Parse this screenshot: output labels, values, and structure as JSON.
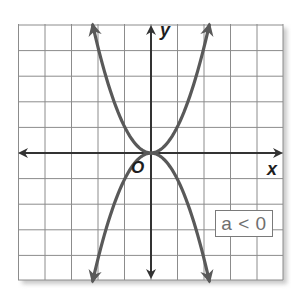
{
  "figure": {
    "x_axis_label": "x",
    "y_axis_label": "y",
    "origin_label": "O",
    "legend_text": "a < 0"
  },
  "colors": {
    "grid": "#8c8c8c",
    "axes": "#333333",
    "curves": "#595959",
    "legend_text": "#6f6f6f",
    "legend_border": "#7a7a7a",
    "shadow": "#c9c9c9"
  },
  "chart_data": {
    "type": "line",
    "title": "",
    "xlabel": "x",
    "ylabel": "y",
    "xlim": [
      -5,
      5
    ],
    "ylim": [
      -5,
      5
    ],
    "grid": true,
    "grid_step": 1,
    "tick_labels_shown": false,
    "origin_label": "O",
    "annotation": "a < 0",
    "series": [
      {
        "name": "y = x^2 (opens upward)",
        "x": [
          -2.2,
          -2,
          -1.5,
          -1,
          -0.5,
          0,
          0.5,
          1,
          1.5,
          2,
          2.2
        ],
        "y": [
          5,
          4.2,
          2.4,
          1.05,
          0.26,
          0,
          0.26,
          1.05,
          2.4,
          4.2,
          5
        ],
        "arrows_at_ends": true
      },
      {
        "name": "y = -x^2 (a < 0, opens downward)",
        "x": [
          -2.2,
          -2,
          -1.5,
          -1,
          -0.5,
          0,
          0.5,
          1,
          1.5,
          2,
          2.2
        ],
        "y": [
          -5,
          -4.2,
          -2.4,
          -1.05,
          -0.26,
          0,
          -0.26,
          -1.05,
          -2.4,
          -4.2,
          -5
        ],
        "arrows_at_ends": true
      }
    ]
  }
}
